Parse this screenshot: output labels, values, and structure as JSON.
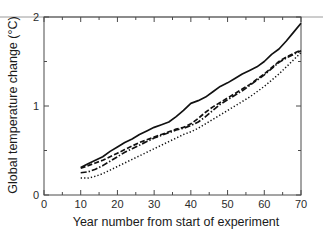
{
  "figure": {
    "background_color": "#ffffff",
    "line_color": "#111111",
    "axis_color": "#4a4a4a"
  },
  "axes": {
    "x_title": "Year number from start of experiment",
    "y_title": "Global temperature change (°C)",
    "x_major_ticks": [
      "0",
      "10",
      "20",
      "30",
      "40",
      "50",
      "60",
      "70"
    ],
    "y_major_ticks": [
      "0",
      "1",
      "2"
    ],
    "x_minor_ticks": [
      "5",
      "15",
      "25",
      "35",
      "45",
      "55",
      "65"
    ],
    "y_minor_ticks": [
      "0.5",
      "1.5"
    ]
  },
  "chart_data": {
    "type": "line",
    "title": "",
    "xlabel": "Year number from start of experiment",
    "ylabel": "Global temperature change (°C)",
    "xlim": [
      0,
      70
    ],
    "ylim": [
      0,
      2
    ],
    "xticks": [
      0,
      10,
      20,
      30,
      40,
      50,
      60,
      70
    ],
    "yticks": [
      0,
      1,
      2
    ],
    "xticks_minor": [
      5,
      15,
      25,
      35,
      45,
      55,
      65
    ],
    "yticks_minor": [
      0.5,
      1.5
    ],
    "grid": false,
    "legend": "none",
    "series": [
      {
        "name": "series-solid",
        "style": "solid",
        "x": [
          10,
          12,
          14,
          16,
          18,
          20,
          22,
          24,
          26,
          28,
          30,
          32,
          34,
          36,
          38,
          40,
          42,
          44,
          46,
          48,
          50,
          52,
          54,
          56,
          58,
          60,
          62,
          64,
          66,
          68,
          70
        ],
        "y": [
          0.31,
          0.35,
          0.39,
          0.43,
          0.49,
          0.54,
          0.59,
          0.63,
          0.68,
          0.72,
          0.76,
          0.79,
          0.82,
          0.88,
          0.95,
          1.03,
          1.06,
          1.1,
          1.16,
          1.22,
          1.26,
          1.31,
          1.36,
          1.4,
          1.44,
          1.5,
          1.58,
          1.64,
          1.73,
          1.83,
          1.93
        ]
      },
      {
        "name": "series-dashed",
        "style": "dashed",
        "x": [
          10,
          12,
          14,
          16,
          18,
          20,
          22,
          24,
          26,
          28,
          30,
          32,
          34,
          36,
          38,
          40,
          42,
          44,
          46,
          48,
          50,
          52,
          54,
          56,
          58,
          60,
          62,
          64,
          66,
          68,
          70
        ],
        "y": [
          0.3,
          0.33,
          0.36,
          0.39,
          0.43,
          0.47,
          0.51,
          0.55,
          0.59,
          0.62,
          0.65,
          0.68,
          0.71,
          0.74,
          0.76,
          0.8,
          0.86,
          0.93,
          0.99,
          1.04,
          1.09,
          1.14,
          1.19,
          1.24,
          1.3,
          1.36,
          1.43,
          1.5,
          1.55,
          1.59,
          1.63
        ]
      },
      {
        "name": "series-dashdot",
        "style": "dashdot",
        "x": [
          10,
          12,
          14,
          16,
          18,
          20,
          22,
          24,
          26,
          28,
          30,
          32,
          34,
          36,
          38,
          40,
          42,
          44,
          46,
          48,
          50,
          52,
          54,
          56,
          58,
          60,
          62,
          64,
          66,
          68,
          70
        ],
        "y": [
          0.25,
          0.26,
          0.29,
          0.33,
          0.38,
          0.43,
          0.48,
          0.52,
          0.56,
          0.6,
          0.64,
          0.67,
          0.7,
          0.73,
          0.75,
          0.78,
          0.82,
          0.88,
          0.95,
          1.02,
          1.07,
          1.12,
          1.17,
          1.23,
          1.29,
          1.35,
          1.42,
          1.49,
          1.54,
          1.58,
          1.62
        ]
      },
      {
        "name": "series-dotted",
        "style": "dotted",
        "x": [
          10,
          12,
          14,
          16,
          18,
          20,
          22,
          24,
          26,
          28,
          30,
          32,
          34,
          36,
          38,
          40,
          42,
          44,
          46,
          48,
          50,
          52,
          54,
          56,
          58,
          60,
          62,
          64,
          66,
          68,
          70
        ],
        "y": [
          0.19,
          0.19,
          0.21,
          0.24,
          0.28,
          0.32,
          0.36,
          0.4,
          0.44,
          0.48,
          0.52,
          0.56,
          0.6,
          0.64,
          0.68,
          0.71,
          0.75,
          0.8,
          0.85,
          0.9,
          0.95,
          1.0,
          1.05,
          1.1,
          1.16,
          1.22,
          1.29,
          1.36,
          1.44,
          1.52,
          1.6
        ]
      }
    ]
  }
}
